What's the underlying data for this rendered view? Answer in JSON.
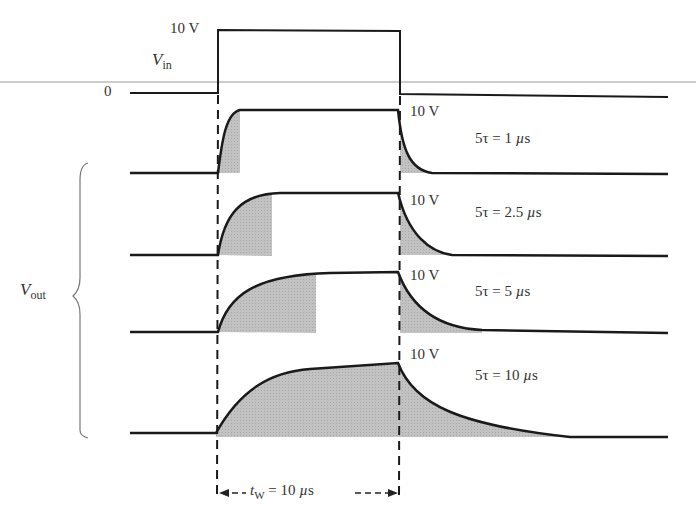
{
  "input": {
    "label_main": "V",
    "label_sub": "in",
    "high_label": "10 V",
    "zero_label": "0"
  },
  "output": {
    "label_main": "V",
    "label_sub": "out",
    "waveforms": [
      {
        "peak_label": "10 V",
        "tau_prefix": "5τ",
        "equals": "=",
        "tau_value": "1",
        "unit_mu": "µ",
        "unit_s": "s"
      },
      {
        "peak_label": "10 V",
        "tau_prefix": "5τ",
        "equals": "=",
        "tau_value": "2.5",
        "unit_mu": "µ",
        "unit_s": "s"
      },
      {
        "peak_label": "10 V",
        "tau_prefix": "5τ",
        "equals": "=",
        "tau_value": "5",
        "unit_mu": "µ",
        "unit_s": "s"
      },
      {
        "peak_label": "10 V",
        "tau_prefix": "5τ",
        "equals": "=",
        "tau_value": "10",
        "unit_mu": "µ",
        "unit_s": "s"
      }
    ]
  },
  "pulse_width": {
    "symbol": "t",
    "symbol_sub": "W",
    "equals": "=",
    "value": "10",
    "unit_mu": "µ",
    "unit_s": "s"
  },
  "colors": {
    "trace": "#1a1a1a",
    "shade": "#b8b8b8",
    "rule": "#9a9a9a"
  }
}
